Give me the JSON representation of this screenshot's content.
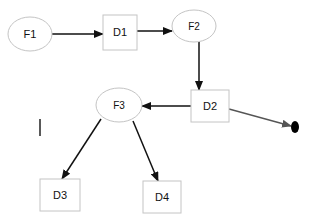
{
  "diagram": {
    "type": "flow-graph",
    "colors": {
      "node_stroke": "#c4c4c4",
      "edge": "#111111",
      "edge_secondary": "#555555",
      "terminal": "#000000",
      "text": "#111111"
    },
    "nodes": [
      {
        "id": "F1",
        "label": "F1",
        "shape": "ellipse"
      },
      {
        "id": "D1",
        "label": "D1",
        "shape": "box"
      },
      {
        "id": "F2",
        "label": "F2",
        "shape": "ellipse"
      },
      {
        "id": "D2",
        "label": "D2",
        "shape": "box"
      },
      {
        "id": "F3",
        "label": "F3",
        "shape": "ellipse"
      },
      {
        "id": "D3",
        "label": "D3",
        "shape": "box"
      },
      {
        "id": "D4",
        "label": "D4",
        "shape": "box"
      },
      {
        "id": "END",
        "label": "",
        "shape": "filled-dot"
      }
    ],
    "edges": [
      {
        "from": "F1",
        "to": "D1"
      },
      {
        "from": "D1",
        "to": "F2"
      },
      {
        "from": "F2",
        "to": "D2"
      },
      {
        "from": "D2",
        "to": "F3"
      },
      {
        "from": "D2",
        "to": "END"
      },
      {
        "from": "F3",
        "to": "D3"
      },
      {
        "from": "F3",
        "to": "D4"
      }
    ]
  }
}
